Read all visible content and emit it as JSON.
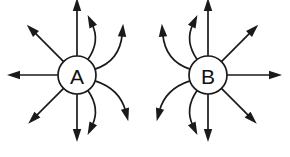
{
  "figure": {
    "background_color": "#ffffff",
    "stroke_color": "#1a1a1a",
    "fill_color": "#1a1a1a",
    "label_color": "#111111",
    "width": 290,
    "height": 157,
    "nodes": [
      {
        "id": "node-a",
        "label": "A",
        "cx": 77,
        "cy": 75,
        "r": 19,
        "arrow_count": 8,
        "curved_side": "right",
        "straight_side": "left"
      },
      {
        "id": "node-b",
        "label": "B",
        "cx": 208,
        "cy": 75,
        "r": 19,
        "arrow_count": 8,
        "curved_side": "left",
        "straight_side": "right"
      }
    ],
    "arrows": {
      "node-a": [
        {
          "name": "arrow-up",
          "kind": "straight",
          "angle_deg": -90,
          "length": 58
        },
        {
          "name": "arrow-upper-left",
          "kind": "straight",
          "angle_deg": -135,
          "length": 52
        },
        {
          "name": "arrow-left",
          "kind": "straight",
          "angle_deg": 180,
          "length": 51
        },
        {
          "name": "arrow-lower-left",
          "kind": "straight",
          "angle_deg": 135,
          "length": 50
        },
        {
          "name": "arrow-down",
          "kind": "straight",
          "angle_deg": 90,
          "length": 48
        },
        {
          "name": "arrow-curved-upper-right",
          "kind": "curved",
          "start_angle_deg": -55,
          "end_angle_deg": -80,
          "length": 42
        },
        {
          "name": "arrow-curved-right-upper",
          "kind": "curved",
          "start_angle_deg": -18,
          "end_angle_deg": -48,
          "length": 50
        },
        {
          "name": "arrow-curved-right-lower",
          "kind": "curved",
          "start_angle_deg": 18,
          "end_angle_deg": 42,
          "length": 50
        },
        {
          "name": "arrow-curved-lower-right",
          "kind": "curved",
          "start_angle_deg": 55,
          "end_angle_deg": 80,
          "length": 42
        }
      ],
      "node-b": [
        {
          "name": "arrow-up",
          "kind": "straight",
          "angle_deg": -90,
          "length": 58
        },
        {
          "name": "arrow-upper-right",
          "kind": "straight",
          "angle_deg": -45,
          "length": 52
        },
        {
          "name": "arrow-right",
          "kind": "straight",
          "angle_deg": 0,
          "length": 55
        },
        {
          "name": "arrow-lower-right",
          "kind": "straight",
          "angle_deg": 45,
          "length": 50
        },
        {
          "name": "arrow-down",
          "kind": "straight",
          "angle_deg": 90,
          "length": 48
        },
        {
          "name": "arrow-curved-upper-left",
          "kind": "curved",
          "start_angle_deg": -125,
          "end_angle_deg": -100,
          "length": 42
        },
        {
          "name": "arrow-curved-left-upper",
          "kind": "curved",
          "start_angle_deg": -162,
          "end_angle_deg": -132,
          "length": 50
        },
        {
          "name": "arrow-curved-left-lower",
          "kind": "curved",
          "start_angle_deg": 162,
          "end_angle_deg": 138,
          "length": 50
        },
        {
          "name": "arrow-curved-lower-left",
          "kind": "curved",
          "start_angle_deg": 125,
          "end_angle_deg": 100,
          "length": 42
        }
      ]
    }
  }
}
